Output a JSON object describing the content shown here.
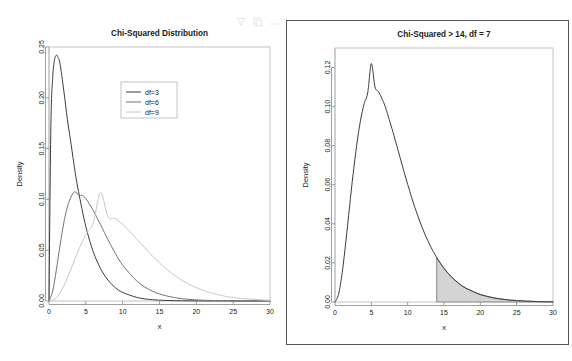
{
  "toolbar": {
    "icons": [
      {
        "name": "filter-icon",
        "glyph": "filter"
      },
      {
        "name": "copy-icon",
        "glyph": "copy"
      },
      {
        "name": "more-options-icon",
        "glyph": "ellipsis"
      }
    ]
  },
  "colors": {
    "curve_df3": "#3d3d3d",
    "curve_df6": "#737373",
    "curve_df9": "#c9c9c9",
    "axis": "#888888",
    "panel_border": "#b4b4b4",
    "outline_border": "#555555",
    "shade_fill": "#cccccc",
    "text": "#1a1a1a"
  },
  "chart_data": [
    {
      "id": "left",
      "type": "line",
      "title": "Chi-Squared Distribution",
      "xlabel": "x",
      "ylabel": "Density",
      "xlim": [
        0,
        30
      ],
      "ylim": [
        0,
        0.25
      ],
      "xticks": [
        0,
        5,
        10,
        15,
        20,
        25,
        30
      ],
      "xticklabels": [
        "0",
        "5",
        "10",
        "15",
        "20",
        "25",
        "30"
      ],
      "yticks": [
        0.0,
        0.05,
        0.1,
        0.15,
        0.2,
        0.25
      ],
      "yticklabels": [
        "0.00",
        "0.05",
        "0.10",
        "0.15",
        "0.20",
        "0.25"
      ],
      "grid": false,
      "legend_position": "upper right",
      "legend_entries": [
        "df=3",
        "df=6",
        "df=9"
      ],
      "series": [
        {
          "name": "df=3",
          "color": "#3d3d3d",
          "peak_x": 1.0,
          "peak_y": 0.242,
          "x": [
            0.0,
            0.25,
            0.5,
            0.75,
            1.0,
            1.25,
            1.5,
            2.0,
            2.5,
            3.0,
            3.5,
            4.0,
            5.0,
            6.0,
            7.0,
            8.0,
            9.0,
            10.0,
            12.0,
            14.0,
            16.0,
            18.0,
            20.0,
            22.0,
            25.0,
            30.0
          ],
          "y": [
            0.0,
            0.1704,
            0.2197,
            0.2374,
            0.242,
            0.2395,
            0.2332,
            0.2076,
            0.1787,
            0.1542,
            0.1291,
            0.108,
            0.0733,
            0.0487,
            0.0319,
            0.0206,
            0.0132,
            0.0085,
            0.0034,
            0.0013,
            0.0005,
            0.0002,
            0.0001,
            3e-05,
            1e-05,
            0.0
          ]
        },
        {
          "name": "df=6",
          "color": "#737373",
          "peak_x": 4.0,
          "peak_y": 0.1276,
          "x": [
            0.0,
            0.5,
            1.0,
            1.5,
            2.0,
            2.5,
            3.0,
            3.5,
            4.0,
            4.5,
            5.0,
            6.0,
            7.0,
            8.0,
            9.0,
            10.0,
            12.0,
            14.0,
            16.0,
            18.0,
            20.0,
            22.0,
            25.0,
            30.0
          ],
          "y": [
            0.0,
            0.0097,
            0.0307,
            0.0549,
            0.0766,
            0.0927,
            0.1025,
            0.1076,
            0.1042,
            0.1038,
            0.1008,
            0.0892,
            0.075,
            0.0604,
            0.0469,
            0.0354,
            0.0191,
            0.0098,
            0.0049,
            0.0023,
            0.0011,
            0.0005,
            0.0001,
            0.0
          ]
        },
        {
          "name": "df=9",
          "color": "#c9c9c9",
          "peak_x": 7.0,
          "peak_y": 0.1069,
          "x": [
            0.0,
            1.0,
            2.0,
            3.0,
            4.0,
            5.0,
            6.0,
            7.0,
            8.0,
            9.0,
            10.0,
            11.0,
            12.0,
            14.0,
            16.0,
            18.0,
            20.0,
            22.0,
            25.0,
            30.0
          ],
          "y": [
            0.0,
            0.003,
            0.0146,
            0.0318,
            0.0499,
            0.0655,
            0.0767,
            0.1069,
            0.0829,
            0.081,
            0.0754,
            0.0682,
            0.0603,
            0.0447,
            0.031,
            0.0206,
            0.0131,
            0.0081,
            0.0034,
            0.0006
          ]
        }
      ]
    },
    {
      "id": "right",
      "type": "area",
      "title": "Chi-Squared > 14, df = 7",
      "xlabel": "x",
      "ylabel": "Density",
      "xlim": [
        0,
        30
      ],
      "ylim": [
        0,
        0.13
      ],
      "xticks": [
        0,
        5,
        10,
        15,
        20,
        25,
        30
      ],
      "xticklabels": [
        "0",
        "5",
        "10",
        "15",
        "20",
        "25",
        "30"
      ],
      "yticks": [
        0.0,
        0.02,
        0.04,
        0.06,
        0.08,
        0.1,
        0.12
      ],
      "yticklabels": [
        "0.00",
        "0.02",
        "0.04",
        "0.06",
        "0.08",
        "0.10",
        "0.12"
      ],
      "grid": false,
      "df": 7,
      "shade_from": 14,
      "shade_to": 30,
      "shade_color": "#cccccc",
      "series": [
        {
          "name": "df=7",
          "color": "#3d3d3d",
          "peak_x": 5.0,
          "peak_y": 0.122,
          "x": [
            0.0,
            0.5,
            1.0,
            1.5,
            2.0,
            2.5,
            3.0,
            3.5,
            4.0,
            4.5,
            5.0,
            5.5,
            6.0,
            6.5,
            7.0,
            8.0,
            9.0,
            10.0,
            11.0,
            12.0,
            13.0,
            14.0,
            15.0,
            16.0,
            17.0,
            18.0,
            20.0,
            22.0,
            24.0,
            26.0,
            28.0,
            30.0
          ],
          "y": [
            0.0,
            0.0041,
            0.0153,
            0.0311,
            0.0487,
            0.0657,
            0.0807,
            0.0927,
            0.1014,
            0.107,
            0.122,
            0.1101,
            0.1076,
            0.1038,
            0.099,
            0.0867,
            0.0733,
            0.0602,
            0.0483,
            0.0381,
            0.0296,
            0.0227,
            0.0172,
            0.0129,
            0.0096,
            0.0071,
            0.0038,
            0.002,
            0.001,
            0.0005,
            0.0002,
            0.0001
          ]
        }
      ]
    }
  ]
}
